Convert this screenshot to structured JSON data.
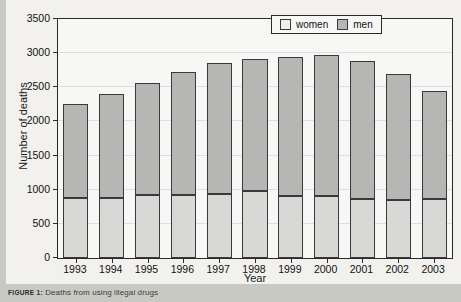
{
  "caption": {
    "prefix": "FIGURE 1:",
    "text": "Deaths from using illegal drugs"
  },
  "legend": {
    "items": [
      {
        "label": "women",
        "color": "#eeeeec"
      },
      {
        "label": "men",
        "color": "#b6b6b4"
      }
    ]
  },
  "chart_data": {
    "type": "bar",
    "stacked": true,
    "title": "",
    "xlabel": "Year",
    "ylabel": "Number of deaths",
    "categories": [
      "1993",
      "1994",
      "1995",
      "1996",
      "1997",
      "1998",
      "1999",
      "2000",
      "2001",
      "2002",
      "2003"
    ],
    "series": [
      {
        "name": "women",
        "color": "#d8d8d6",
        "values": [
          880,
          880,
          930,
          930,
          940,
          980,
          910,
          910,
          870,
          850,
          860
        ]
      },
      {
        "name": "men",
        "color": "#b6b6b4",
        "values": [
          1370,
          1520,
          1640,
          1790,
          1920,
          1940,
          2030,
          2060,
          2020,
          1840,
          1580
        ]
      }
    ],
    "totals": [
      2250,
      2400,
      2570,
      2720,
      2860,
      2920,
      2940,
      2970,
      2890,
      2690,
      2440
    ],
    "ylim": [
      0,
      3500
    ],
    "yticks": [
      0,
      500,
      1000,
      1500,
      2000,
      2500,
      3000,
      3500
    ],
    "ytick_labels": [
      "0",
      "500",
      "1000",
      "1500",
      "2000",
      "2500",
      "3000",
      "3500"
    ],
    "grid": true,
    "legend_position": "top-right"
  }
}
